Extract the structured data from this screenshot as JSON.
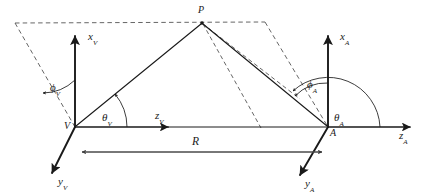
{
  "figure": {
    "background_color": "#ffffff",
    "line_color": "#1a1a1a",
    "dashed_color": "#555555"
  },
  "points": {
    "p": {
      "label": "P",
      "x": 202,
      "y": 22
    },
    "v_origin": {
      "label": "V",
      "x": 75,
      "y": 127
    },
    "a_origin": {
      "label": "A",
      "x": 328,
      "y": 127
    }
  },
  "axes": {
    "x_v": {
      "label": "x",
      "subscript": "V",
      "label_x": 88,
      "label_y": 31
    },
    "z_v": {
      "label": "z",
      "subscript": "V",
      "label_x": 155,
      "label_y": 110
    },
    "y_v": {
      "label": "y",
      "subscript": "V",
      "label_x": 58,
      "label_y": 176
    },
    "x_a": {
      "label": "x",
      "subscript": "A",
      "label_x": 340,
      "label_y": 31
    },
    "z_a": {
      "label": "z",
      "subscript": "A",
      "label_x": 399,
      "label_y": 130
    },
    "y_a": {
      "label": "y",
      "subscript": "A",
      "label_x": 305,
      "label_y": 178
    }
  },
  "angles": {
    "phi_v": {
      "label": "ϕ",
      "subscript": "V",
      "label_x": 50,
      "label_y": 82
    },
    "theta_v": {
      "label": "θ",
      "subscript": "V",
      "label_x": 102,
      "label_y": 112
    },
    "phi_a": {
      "label": "ϕ",
      "subscript": "A",
      "label_x": 307,
      "label_y": 79
    },
    "theta_a": {
      "label": "θ",
      "subscript": "A",
      "label_x": 334,
      "label_y": 112
    }
  },
  "range": {
    "label": "R",
    "label_x": 192,
    "label_y": 136,
    "from_x": 75,
    "to_x": 328,
    "line_y": 152
  }
}
